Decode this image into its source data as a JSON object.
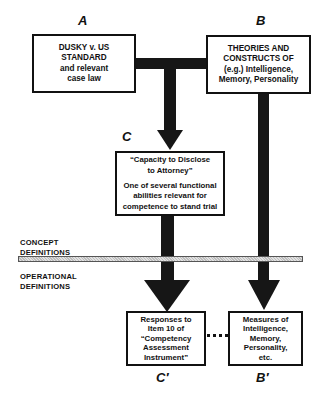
{
  "diagram": {
    "colors": {
      "line": "#161616",
      "box_border": "#111111",
      "divider_fill": "#cfcfcf",
      "background": "#ffffff"
    },
    "labels": {
      "A": "A",
      "B": "B",
      "C": "C",
      "C_prime": "C′",
      "B_prime": "B′"
    },
    "boxes": {
      "A": {
        "lines": [
          "DUSKY v. US",
          "STANDARD",
          "and relevant",
          "case law"
        ]
      },
      "B": {
        "lines": [
          "THEORIES AND",
          "CONSTRUCTS OF",
          "(e.g.) Intelligence,",
          "Memory, Personality"
        ]
      },
      "C": {
        "title_lines": [
          "“Capacity to Disclose",
          "to Attorney”"
        ],
        "body_lines": [
          "One of several functional",
          "abilities relevant for",
          "competence to stand trial"
        ]
      },
      "C_prime": {
        "lines": [
          "Responses to",
          "Item 10 of",
          "“Competency",
          "Assessment",
          "Instrument”"
        ]
      },
      "B_prime": {
        "lines": [
          "Measures of",
          "Intelligence,",
          "Memory,",
          "Personality,",
          "etc."
        ]
      }
    },
    "divider": {
      "above_label": [
        "CONCEPT",
        "DEFINITIONS"
      ],
      "below_label": [
        "OPERATIONAL",
        "DEFINITIONS"
      ]
    },
    "connectors": [
      {
        "from": "A",
        "to": "C",
        "type": "arrow"
      },
      {
        "from": "B",
        "to": "C",
        "type": "arrow"
      },
      {
        "from": "C",
        "to": "C_prime",
        "type": "arrow"
      },
      {
        "from": "B",
        "to": "B_prime",
        "type": "arrow"
      },
      {
        "from": "C_prime",
        "to": "B_prime",
        "type": "dotted-line"
      }
    ]
  }
}
